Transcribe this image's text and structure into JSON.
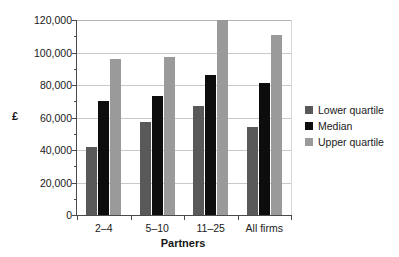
{
  "chart_data": {
    "type": "bar",
    "title": "",
    "subtitle": "",
    "xlabel": "Partners",
    "ylabel": "£",
    "categories": [
      "2–4",
      "5–10",
      "11–25",
      "All firms"
    ],
    "series": [
      {
        "name": "Lower quartile",
        "color": "#595959",
        "values": [
          42000,
          57000,
          67000,
          54000
        ]
      },
      {
        "name": "Median",
        "color": "#0d0d0d",
        "values": [
          70000,
          73000,
          86000,
          81000
        ]
      },
      {
        "name": "Upper quartile",
        "color": "#9a9a9a",
        "values": [
          96000,
          97000,
          120000,
          111000
        ]
      }
    ],
    "ylim": [
      0,
      120000
    ],
    "y_major_ticks": [
      0,
      20000,
      40000,
      60000,
      80000,
      100000,
      120000
    ],
    "y_tick_labels": [
      "0",
      "20,000",
      "40,000",
      "60,000",
      "80,000",
      "100,000",
      "120,000"
    ],
    "y_minor_tick_interval": 10000,
    "grid": true,
    "grid_axis": "y",
    "legend_position": "right"
  },
  "legend": {
    "items": [
      {
        "label": "Lower quartile",
        "color": "#595959"
      },
      {
        "label": "Median",
        "color": "#0d0d0d"
      },
      {
        "label": "Upper quartile",
        "color": "#9a9a9a"
      }
    ]
  }
}
